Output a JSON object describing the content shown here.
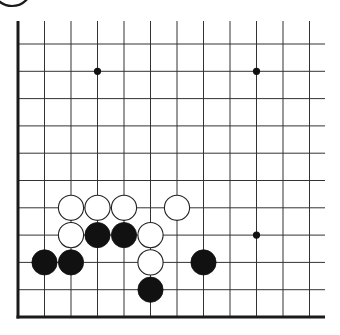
{
  "diagram": {
    "type": "go-board-fragment",
    "corner": "bottom-left",
    "colors": {
      "background": "#ffffff",
      "line": "#333333",
      "edge": "#1a1a1a",
      "black_stone": "#111111",
      "white_stone_fill": "#ffffff",
      "white_stone_stroke": "#222222"
    },
    "grid": {
      "origin_x": 18,
      "origin_y": 44,
      "dx": 26.5,
      "dy": 27.3,
      "columns": 12,
      "rows": 11,
      "top_open_y": 21,
      "right_open_x": 325,
      "left_edge": true,
      "bottom_edge": true
    },
    "star_points": [
      {
        "col": 3,
        "row": 1
      },
      {
        "col": 9,
        "row": 1
      },
      {
        "col": 9,
        "row": 7
      }
    ],
    "stones": [
      {
        "color": "white",
        "col": 2,
        "row": 6
      },
      {
        "color": "white",
        "col": 3,
        "row": 6
      },
      {
        "color": "white",
        "col": 4,
        "row": 6
      },
      {
        "color": "white",
        "col": 6,
        "row": 6
      },
      {
        "color": "white",
        "col": 2,
        "row": 7
      },
      {
        "color": "black",
        "col": 3,
        "row": 7
      },
      {
        "color": "black",
        "col": 4,
        "row": 7
      },
      {
        "color": "white",
        "col": 5,
        "row": 7
      },
      {
        "color": "black",
        "col": 1,
        "row": 8
      },
      {
        "color": "black",
        "col": 2,
        "row": 8
      },
      {
        "color": "white",
        "col": 5,
        "row": 8
      },
      {
        "color": "black",
        "col": 7,
        "row": 8
      },
      {
        "color": "black",
        "col": 5,
        "row": 9
      }
    ],
    "label_circle_arc": {
      "cx": 12,
      "cy": -14,
      "r": 20
    }
  }
}
